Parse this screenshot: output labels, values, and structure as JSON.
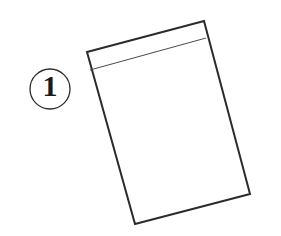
{
  "figure": {
    "background_color": "#ffffff",
    "line_color": "#2b2b2b",
    "thin_line_color": "#4a4a4a",
    "canvas_width": 281,
    "canvas_height": 236
  },
  "step_marker": {
    "label": "1",
    "shape": "circle",
    "center_x": 50,
    "center_y": 89,
    "radius": 20,
    "stroke_color": "#2b2b2b",
    "stroke_width": 1.3,
    "text_color": "#1a1a1a"
  },
  "envelope": {
    "name": "envelope-outline",
    "fill": "none",
    "stroke_color": "#2b2b2b",
    "stroke_width": 2,
    "corners": {
      "top_left": [
        87,
        52
      ],
      "top_right": [
        204,
        21
      ],
      "bottom_right": [
        250,
        194
      ],
      "bottom_left": [
        135,
        224
      ]
    },
    "outline_path": "M 87 52 L 204 21 L 250 194 L 135 224 Z",
    "flap": {
      "name": "envelope-flap-line",
      "start": [
        90,
        70
      ],
      "end": [
        206,
        38
      ],
      "path": "M 90 70 L 206 38",
      "stroke_color": "#4a4a4a",
      "stroke_width": 1
    }
  }
}
